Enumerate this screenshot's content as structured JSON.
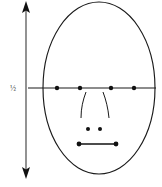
{
  "figure": {
    "background_color": "#ffffff",
    "ink_color": "#1a1a1a",
    "width": 162,
    "height": 187
  },
  "measurement": {
    "label": "½",
    "label_meaning": "one half",
    "description": "vertical double-headed arrow spanning full head height",
    "arrow_x": 26,
    "arrow_top_y": 2,
    "arrow_bottom_y": 178,
    "label_x": 13,
    "label_y": 90
  },
  "head": {
    "name": "face-oval",
    "center_x": 99,
    "center_y": 88,
    "radius_x": 56,
    "radius_y": 86
  },
  "eye_line": {
    "name": "horizontal-eye-guide",
    "y": 88,
    "x_start": 28,
    "x_end": 156
  },
  "eye_markers": {
    "count": 4,
    "radius": 2.2,
    "points": [
      {
        "name": "outer-left-eye-corner",
        "x": 57,
        "y": 88
      },
      {
        "name": "inner-left-eye-corner",
        "x": 80,
        "y": 88
      },
      {
        "name": "inner-right-eye-corner",
        "x": 111,
        "y": 88
      },
      {
        "name": "outer-right-eye-corner",
        "x": 134,
        "y": 88
      }
    ]
  },
  "nose": {
    "left_side_path": "M 86 92 C 83 100, 81 108, 81 118",
    "right_side_path": "M 103 92 C 106 100, 108 108, 109 118",
    "nostrils": {
      "radius": 2.0,
      "points": [
        {
          "name": "left-nostril",
          "x": 88,
          "y": 129
        },
        {
          "name": "right-nostril",
          "x": 100,
          "y": 129
        }
      ]
    }
  },
  "mouth": {
    "name": "mouth-line",
    "x_start": 79,
    "x_end": 116,
    "y": 144,
    "end_dot_radius": 2.4
  },
  "annotations": []
}
